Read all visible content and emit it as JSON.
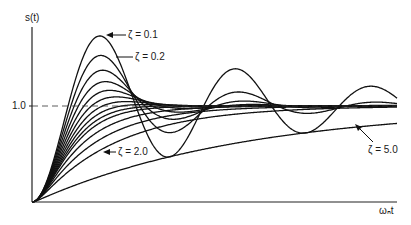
{
  "chart_data": {
    "type": "line",
    "title": "",
    "xlabel": "ωₙt",
    "ylabel": "s(t)",
    "xlim": [
      0,
      17
    ],
    "ylim": [
      0,
      1.9
    ],
    "y_ticks": [
      {
        "value": 1.0,
        "label": "1.0"
      }
    ],
    "reference_line": {
      "y": 1.0,
      "style": "dashed"
    },
    "grid": false,
    "legend": "annotations",
    "series_formula": "unit step response of 2nd-order system: s(t) = 1 - e^{-ζωₙt}(cos ωd t + ζ/√(1-ζ²) sin ωd t)",
    "zeta_values": [
      0.1,
      0.2,
      0.3,
      0.4,
      0.5,
      0.6,
      0.7,
      0.8,
      0.9,
      1.0,
      1.2,
      1.5,
      2.0,
      5.0
    ],
    "annotations": [
      {
        "text": "ζ = 0.1",
        "zeta": 0.1
      },
      {
        "text": "ζ = 0.2",
        "zeta": 0.2
      },
      {
        "text": "ζ = 2.0",
        "zeta": 2.0
      },
      {
        "text": "ζ = 5.0",
        "zeta": 5.0
      }
    ]
  },
  "labels": {
    "y_axis": "s(t)",
    "x_axis": "ωₙt",
    "tick_1": "1.0",
    "z01": "ζ = 0.1",
    "z02": "ζ = 0.2",
    "z20": "ζ = 2.0",
    "z50": "ζ = 5.0"
  }
}
